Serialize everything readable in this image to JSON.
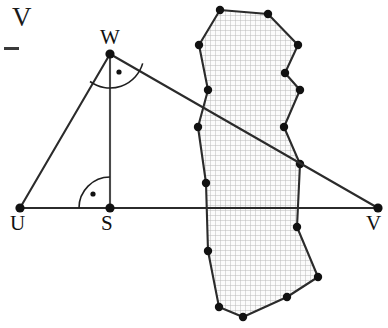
{
  "figure": {
    "type": "geometry-diagram",
    "canvas": {
      "width": 388,
      "height": 328,
      "background": "#ffffff"
    },
    "colors": {
      "stroke": "#2b2b2b",
      "vertex_dot": "#111111",
      "hatch_grid": "#b9b9b9",
      "hatch_fill": "#fbfbfb",
      "label_text": "#111111"
    },
    "labels": {
      "corner_v": "V",
      "u": "U",
      "s": "S",
      "w": "W",
      "v": "V"
    },
    "label_positions": {
      "corner_v": {
        "x": 12,
        "y": 4
      },
      "u": {
        "x": 10,
        "y": 213
      },
      "s": {
        "x": 101,
        "y": 213
      },
      "w": {
        "x": 100,
        "y": 27
      },
      "v": {
        "x": 366,
        "y": 213
      }
    },
    "points": {
      "U": {
        "x": 20,
        "y": 208
      },
      "S": {
        "x": 110,
        "y": 208
      },
      "W": {
        "x": 110,
        "y": 54
      },
      "V": {
        "x": 378,
        "y": 208
      }
    },
    "segments": [
      {
        "name": "base-uv",
        "from": "U",
        "to": "V"
      },
      {
        "name": "side-uw",
        "from": "U",
        "to": "W"
      },
      {
        "name": "side-wv",
        "from": "W",
        "to": "V"
      },
      {
        "name": "altitude-ws",
        "from": "W",
        "to": "S"
      }
    ],
    "angle_marks": [
      {
        "name": "angle-at-w",
        "vertex": "W",
        "style": "arc-with-dot",
        "radius": 34,
        "start_deg": 96,
        "end_deg": 206
      },
      {
        "name": "angle-at-s",
        "vertex": "S",
        "style": "quarter-arc-with-dot",
        "radius": 31,
        "start_deg": 180,
        "end_deg": 270
      }
    ],
    "polygon": {
      "name": "hatched-region",
      "hatch": "square-grid",
      "grid_spacing": 5,
      "vertices": [
        {
          "x": 220,
          "y": 10
        },
        {
          "x": 268,
          "y": 14
        },
        {
          "x": 298,
          "y": 45
        },
        {
          "x": 285,
          "y": 73
        },
        {
          "x": 300,
          "y": 90
        },
        {
          "x": 284,
          "y": 127
        },
        {
          "x": 300,
          "y": 164
        },
        {
          "x": 297,
          "y": 227
        },
        {
          "x": 318,
          "y": 277
        },
        {
          "x": 287,
          "y": 297
        },
        {
          "x": 243,
          "y": 317
        },
        {
          "x": 219,
          "y": 307
        },
        {
          "x": 208,
          "y": 251
        },
        {
          "x": 206,
          "y": 183
        },
        {
          "x": 198,
          "y": 127
        },
        {
          "x": 208,
          "y": 90
        },
        {
          "x": 199,
          "y": 45
        }
      ]
    },
    "crop_dash": {
      "x": 4,
      "y": 47,
      "width": 15,
      "height": 3
    }
  }
}
